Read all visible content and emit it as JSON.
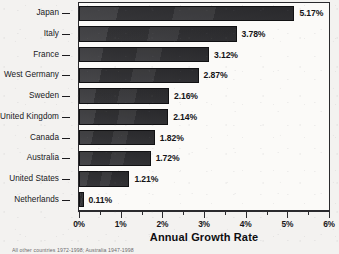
{
  "chart_data": {
    "type": "bar",
    "orientation": "horizontal",
    "title": "",
    "xlabel": "Annual Growth Rate",
    "ylabel": "",
    "xlim": [
      0,
      6
    ],
    "xunit": "%",
    "grid": false,
    "legend": null,
    "xtick_labels": [
      "0%",
      "1%",
      "2%",
      "3%",
      "4%",
      "5%",
      "6%"
    ],
    "xtick_values": [
      0,
      1,
      2,
      3,
      4,
      5,
      6
    ],
    "xminor_tick_values": [
      0.5,
      1.5,
      2.5,
      3.5,
      4.5,
      5.5
    ],
    "categories": [
      "Japan",
      "Italy",
      "France",
      "West Germany",
      "Sweden",
      "United Kingdom",
      "Canada",
      "Australia",
      "United States",
      "Netherlands"
    ],
    "values": [
      5.17,
      3.78,
      3.12,
      2.87,
      2.16,
      2.14,
      1.82,
      1.72,
      1.21,
      0.11
    ],
    "value_labels": [
      "5.17%",
      "3.78%",
      "3.12%",
      "2.87%",
      "2.16%",
      "2.14%",
      "1.82%",
      "1.72%",
      "1.21%",
      "0.11%"
    ],
    "bar_color": "#2e2e31"
  },
  "colors": {
    "background": "#f3f2f0",
    "plot_background": "#fbfaf8",
    "axis": "#2a2a2d",
    "text": "#17171a",
    "bar": "#2e2e31"
  },
  "footnote": {
    "text": "All other countries 1972-1998; Australia 1947-1998"
  }
}
